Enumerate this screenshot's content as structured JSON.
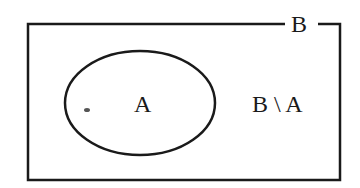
{
  "diagram": {
    "type": "venn",
    "set_outer": {
      "label": "B",
      "shape": "rectangle"
    },
    "set_inner": {
      "label": "A",
      "shape": "ellipse"
    },
    "region_label": "B \\ A",
    "colors": {
      "stroke": "#1a1a1a",
      "background": "#ffffff"
    }
  }
}
